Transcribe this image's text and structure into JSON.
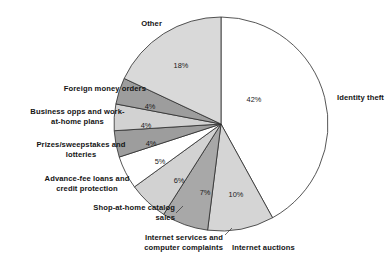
{
  "chart_data": {
    "type": "pie",
    "title": "",
    "subtitle": "",
    "xlabel": "",
    "ylabel": "",
    "legend_position": "none",
    "grid": false,
    "start_angle_deg": 0,
    "direction": "clockwise",
    "units": "percent",
    "categories": [
      "Identity theft",
      "Internet auctions",
      "Internet services and computer complaints",
      "Shop-at-home catalog sales",
      "Advance-fee loans and credit protection",
      "Prizes/sweepstakes and lotteries",
      "Business opps and work-at-home plans",
      "Foreign money orders",
      "Other"
    ],
    "values": [
      42,
      10,
      7,
      6,
      5,
      4,
      4,
      4,
      18
    ],
    "value_labels": [
      "42%",
      "10%",
      "7%",
      "6%",
      "5%",
      "4%",
      "4%",
      "4%",
      "18%"
    ],
    "colors": [
      "#ffffff",
      "#d5d5d5",
      "#a8a8a8",
      "#d2d2d2",
      "#ffffff",
      "#9d9d9d",
      "#d2d2d2",
      "#9d9d9d",
      "#d9d9d9"
    ],
    "slice_outline_color": "#2b2b2b"
  },
  "chart": {
    "geometry": {
      "center_x": 221,
      "center_y": 124,
      "radius": 107
    },
    "slices": [
      {
        "key": "identity-theft",
        "name": "Identity theft",
        "value": 42,
        "pct_label": "42%",
        "fill": "#ffffff",
        "pct_x": 254,
        "pct_y": 102,
        "label_text": "Identity theft",
        "label_left": 337,
        "label_top": 93,
        "label_width": 52,
        "label_align": "left-align"
      },
      {
        "key": "internet-auctions",
        "name": "Internet auctions",
        "value": 10,
        "pct_label": "10%",
        "fill": "#d5d5d5",
        "pct_x": 236,
        "pct_y": 197,
        "label_text": "Internet auctions",
        "label_left": 232,
        "label_top": 243,
        "label_width": 90,
        "label_align": "left-align"
      },
      {
        "key": "internet-services-computer-complaints",
        "name": "Internet services and computer complaints",
        "value": 7,
        "pct_label": "7%",
        "fill": "#a8a8a8",
        "pct_x": 205,
        "pct_y": 195,
        "label_text": "Internet services and\ncomputer complaints",
        "label_left": 103,
        "label_top": 233,
        "label_width": 120,
        "label_align": "right-align"
      },
      {
        "key": "shop-at-home-catalog-sales",
        "name": "Shop-at-home catalog sales",
        "value": 6,
        "pct_label": "6%",
        "fill": "#d2d2d2",
        "pct_x": 179,
        "pct_y": 183,
        "label_text": "Shop-at-home catalog\nsales",
        "label_left": 55,
        "label_top": 203,
        "label_width": 120,
        "label_align": "right-align"
      },
      {
        "key": "advance-fee-loans-credit-protection",
        "name": "Advance-fee loans and credit protection",
        "value": 5,
        "pct_label": "5%",
        "fill": "#ffffff",
        "pct_x": 160,
        "pct_y": 164,
        "label_text": "Advance-fee loans and\ncredit protection",
        "label_left": 26,
        "label_top": 174,
        "label_width": 122,
        "label_align": "center-align"
      },
      {
        "key": "prizes-sweepstakes-lotteries",
        "name": "Prizes/sweepstakes and lotteries",
        "value": 4,
        "pct_label": "4%",
        "fill": "#9d9d9d",
        "pct_x": 151,
        "pct_y": 146,
        "label_text": "Prizes/sweepstakes and\nlotteries",
        "label_left": 17,
        "label_top": 140,
        "label_width": 128,
        "label_align": "center-align"
      },
      {
        "key": "business-opps-work-at-home-plans",
        "name": "Business opps and work-at-home plans",
        "value": 4,
        "pct_label": "4%",
        "fill": "#d2d2d2",
        "pct_x": 146,
        "pct_y": 128,
        "label_text": "Business opps and work-\nat-home plans",
        "label_left": 10,
        "label_top": 107,
        "label_width": 135,
        "label_align": "center-align"
      },
      {
        "key": "foreign-money-orders",
        "name": "Foreign money orders",
        "value": 4,
        "pct_label": "4%",
        "fill": "#9d9d9d",
        "pct_x": 150,
        "pct_y": 109,
        "label_text": "Foreign money orders",
        "label_left": 34,
        "label_top": 84,
        "label_width": 112,
        "label_align": "right-align"
      },
      {
        "key": "other",
        "name": "Other",
        "value": 18,
        "pct_label": "18%",
        "fill": "#d9d9d9",
        "pct_x": 181,
        "pct_y": 68,
        "label_text": "Other",
        "label_left": 112,
        "label_top": 19,
        "label_width": 50,
        "label_align": "right-align"
      }
    ],
    "leaders": [
      {
        "key": "leader-shop-at-home",
        "x1": 176,
        "y1": 213,
        "x2": 183,
        "y2": 206
      },
      {
        "key": "leader-internet-services",
        "x1": 225,
        "y1": 235,
        "x2": 232,
        "y2": 228
      }
    ]
  }
}
